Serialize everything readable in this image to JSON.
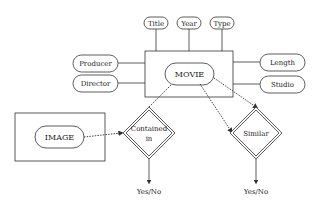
{
  "diagram": {
    "central_entity": {
      "label": "MOVIE"
    },
    "attributes_top": [
      {
        "label": "Title"
      },
      {
        "label": "Year"
      },
      {
        "label": "Type"
      }
    ],
    "attributes_left": [
      {
        "label": "Producer"
      },
      {
        "label": "Director"
      }
    ],
    "attributes_right": [
      {
        "label": "Length"
      },
      {
        "label": "Studio"
      }
    ],
    "image_entity": {
      "label": "IMAGE"
    },
    "relations": [
      {
        "label_line1": "Contained",
        "label_line2": "in",
        "output": "Yes/No"
      },
      {
        "label_line1": "Similar",
        "label_line2": "",
        "output": "Yes/No"
      }
    ],
    "colors": {
      "stroke": "#333333",
      "text": "#222222",
      "background": "#ffffff"
    }
  }
}
